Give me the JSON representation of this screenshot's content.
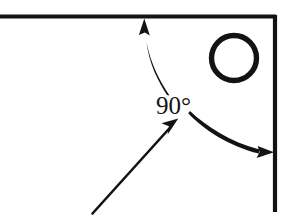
{
  "figure": {
    "kind": "geometry-diagram",
    "title_visible": false,
    "background_color": "#ffffff",
    "ink_color": "#131313",
    "width": 293,
    "height": 222
  },
  "labels": {
    "angle": "90°"
  },
  "shapes": {
    "corner_lines": {
      "name": "right-angle-corner",
      "horizontal": {
        "x1": 0,
        "y1": 16,
        "x2": 276,
        "y2": 16,
        "stroke_width": 4
      },
      "vertical": {
        "x1": 276,
        "y1": 16,
        "x2": 276,
        "y2": 212,
        "stroke_width": 4
      }
    },
    "circle": {
      "name": "circle-outline",
      "cx": 234,
      "cy": 58,
      "r": 23,
      "stroke_width": 5,
      "fill": "none"
    }
  },
  "arrows": {
    "up_curved": {
      "name": "curved-arrow-to-horizontal-line",
      "from": [
        170,
        96
      ],
      "to": [
        144,
        20
      ],
      "direction": "up",
      "style": "curved"
    },
    "right_curved": {
      "name": "curved-arrow-to-vertical-line",
      "from": [
        190,
        112
      ],
      "to": [
        274,
        153
      ],
      "direction": "right",
      "style": "curved"
    },
    "pointer_straight": {
      "name": "straight-pointer-arrow-to-label",
      "from": [
        92,
        214
      ],
      "to": [
        178,
        119
      ],
      "direction": "up-right",
      "style": "straight"
    }
  }
}
